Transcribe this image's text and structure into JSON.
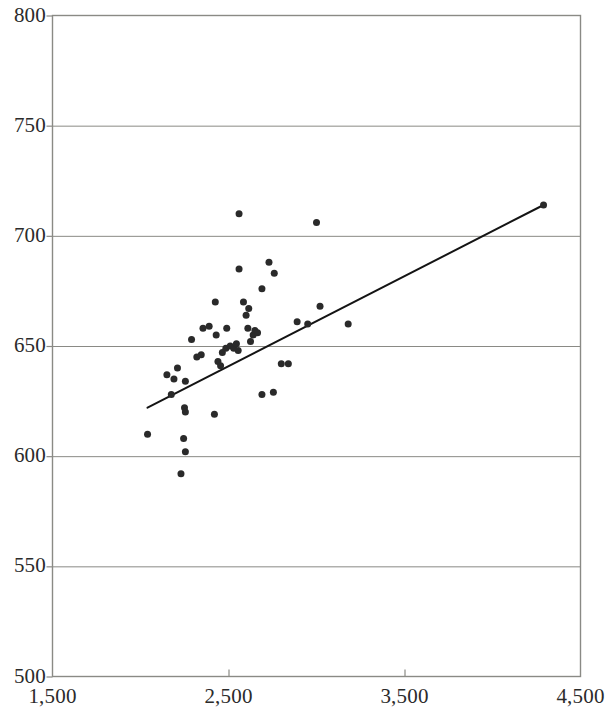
{
  "chart_data": {
    "type": "scatter",
    "title": "",
    "subtitle": "",
    "xlabel": "",
    "ylabel": "",
    "xlim": [
      1500,
      4500
    ],
    "ylim": [
      500,
      800
    ],
    "xticks": [
      1500,
      2500,
      3500,
      4500
    ],
    "yticks": [
      500,
      550,
      600,
      650,
      700,
      750,
      800
    ],
    "xtick_labels": [
      "1,500",
      "2,500",
      "3,500",
      "4,500"
    ],
    "ytick_labels": [
      "500",
      "550",
      "600",
      "650",
      "700",
      "750",
      "800"
    ],
    "grid": {
      "horizontal": true,
      "vertical": false
    },
    "legend": {
      "visible": false,
      "position": "none",
      "entries": []
    },
    "marker": {
      "shape": "circle",
      "size_px": 7,
      "color": "#2a2a2a"
    },
    "points": [
      {
        "x": 2040,
        "y": 610
      },
      {
        "x": 2210,
        "y": 640
      },
      {
        "x": 2190,
        "y": 635
      },
      {
        "x": 2150,
        "y": 637
      },
      {
        "x": 2175,
        "y": 628
      },
      {
        "x": 2255,
        "y": 634
      },
      {
        "x": 2290,
        "y": 653
      },
      {
        "x": 2250,
        "y": 622
      },
      {
        "x": 2255,
        "y": 620
      },
      {
        "x": 2320,
        "y": 645
      },
      {
        "x": 2345,
        "y": 646
      },
      {
        "x": 2355,
        "y": 658
      },
      {
        "x": 2390,
        "y": 659
      },
      {
        "x": 2425,
        "y": 670
      },
      {
        "x": 2430,
        "y": 655
      },
      {
        "x": 2440,
        "y": 643
      },
      {
        "x": 2455,
        "y": 641
      },
      {
        "x": 2465,
        "y": 647
      },
      {
        "x": 2490,
        "y": 658
      },
      {
        "x": 2485,
        "y": 649
      },
      {
        "x": 2510,
        "y": 650
      },
      {
        "x": 2530,
        "y": 649
      },
      {
        "x": 2545,
        "y": 651
      },
      {
        "x": 2555,
        "y": 648
      },
      {
        "x": 2560,
        "y": 685
      },
      {
        "x": 2585,
        "y": 670
      },
      {
        "x": 2600,
        "y": 664
      },
      {
        "x": 2610,
        "y": 658
      },
      {
        "x": 2615,
        "y": 667
      },
      {
        "x": 2625,
        "y": 652
      },
      {
        "x": 2640,
        "y": 655
      },
      {
        "x": 2650,
        "y": 657
      },
      {
        "x": 2665,
        "y": 656
      },
      {
        "x": 2690,
        "y": 676
      },
      {
        "x": 2730,
        "y": 688
      },
      {
        "x": 2760,
        "y": 683
      },
      {
        "x": 2560,
        "y": 710
      },
      {
        "x": 2245,
        "y": 608
      },
      {
        "x": 2255,
        "y": 602
      },
      {
        "x": 2230,
        "y": 592
      },
      {
        "x": 2420,
        "y": 619
      },
      {
        "x": 2690,
        "y": 628
      },
      {
        "x": 2755,
        "y": 629
      },
      {
        "x": 2800,
        "y": 642
      },
      {
        "x": 2840,
        "y": 642
      },
      {
        "x": 2950,
        "y": 660
      },
      {
        "x": 3020,
        "y": 668
      },
      {
        "x": 3000,
        "y": 706
      },
      {
        "x": 2890,
        "y": 661
      },
      {
        "x": 3180,
        "y": 660
      },
      {
        "x": 4290,
        "y": 714
      }
    ],
    "trendline": {
      "visible": true,
      "color": "#141414",
      "width_px": 2,
      "x_start": 2040,
      "y_start": 622,
      "x_end": 4290,
      "y_end": 714
    }
  },
  "axes": {
    "frame_color": "#8a8a85",
    "gridline_color": "#8a8a85",
    "background": "#ffffff"
  },
  "caption": {
    "text": ""
  }
}
